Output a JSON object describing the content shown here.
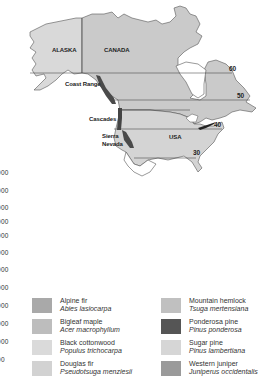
{
  "map": {
    "region_labels": [
      {
        "id": "alaska",
        "text": "ALASKA",
        "x": 52,
        "y": 47
      },
      {
        "id": "canada",
        "text": "CANADA",
        "x": 104,
        "y": 47
      },
      {
        "id": "usa",
        "text": "USA",
        "x": 169,
        "y": 134
      }
    ],
    "range_labels": [
      {
        "id": "coast-range",
        "text": "Coast Range",
        "x": 65,
        "y": 81
      },
      {
        "id": "cascades",
        "text": "Cascades",
        "x": 89,
        "y": 116
      },
      {
        "id": "sierra",
        "text": "Sierra",
        "x": 102,
        "y": 133
      },
      {
        "id": "nevada",
        "text": "Nevada",
        "x": 102,
        "y": 141
      }
    ],
    "latitude_labels": [
      {
        "id": "lat-60",
        "text": "60",
        "x": 229,
        "y": 66
      },
      {
        "id": "lat-50",
        "text": "50",
        "x": 237,
        "y": 93
      },
      {
        "id": "lat-40",
        "text": "40",
        "x": 214,
        "y": 122
      },
      {
        "id": "lat-30",
        "text": "30",
        "x": 193,
        "y": 150
      }
    ],
    "colors": {
      "land": "#d8d8d8",
      "land_dark": "#c6c6c6",
      "outline": "#555555",
      "range_band": "#4a4a4a"
    }
  },
  "axis_numbers": [
    "000",
    "000",
    "000",
    "000",
    "000",
    "000",
    "000",
    "000",
    "000",
    "000",
    "000",
    "00"
  ],
  "axis_number_positions": [
    170,
    188,
    205,
    219,
    233,
    250,
    267,
    285,
    303,
    321,
    339,
    357
  ],
  "legend": {
    "left": [
      {
        "common": "Alpine fir",
        "latin": "Abies lasiocarpa",
        "color": "#a9a9a9"
      },
      {
        "common": "Bigleaf maple",
        "latin": "Acer macrophyllum",
        "color": "#bdbdbd"
      },
      {
        "common": "Black cottonwood",
        "latin": "Populus trichocarpa",
        "color": "#dadada"
      },
      {
        "common": "Douglas fir",
        "latin": "Pseudotsuga menziesii",
        "color": "#d2d2d2"
      }
    ],
    "right": [
      {
        "common": "Mountain hemlock",
        "latin": "Tsuga mertensiana",
        "color": "#c0c0c0"
      },
      {
        "common": "Ponderosa pine",
        "latin": "Pinus ponderosa",
        "color": "#555555"
      },
      {
        "common": "Sugar pine",
        "latin": "Pinus lambertiana",
        "color": "#d6d6d6"
      },
      {
        "common": "Western juniper",
        "latin": "Juniperus occidentalis",
        "color": "#9a9a9a"
      }
    ]
  }
}
